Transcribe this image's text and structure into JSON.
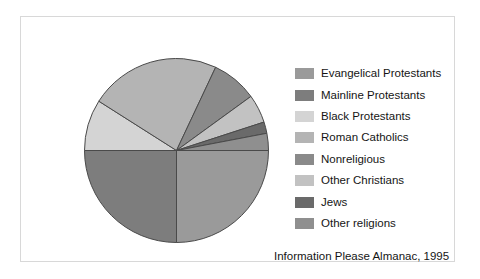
{
  "figure": {
    "caption": "Information Please Almanac, 1995"
  },
  "legend": {
    "position": "right",
    "items": [
      {
        "label": "Evangelical Protestants",
        "color": "#9a9a9a",
        "swatch_name": "legend-swatch-evangelical-protestants"
      },
      {
        "label": "Mainline Protestants",
        "color": "#7d7d7d",
        "swatch_name": "legend-swatch-mainline-protestants"
      },
      {
        "label": "Black Protestants",
        "color": "#d4d4d4",
        "swatch_name": "legend-swatch-black-protestants"
      },
      {
        "label": "Roman Catholics",
        "color": "#b4b4b4",
        "swatch_name": "legend-swatch-roman-catholics"
      },
      {
        "label": "Nonreligious",
        "color": "#8a8a8a",
        "swatch_name": "legend-swatch-nonreligious"
      },
      {
        "label": "Other Christians",
        "color": "#c2c2c2",
        "swatch_name": "legend-swatch-other-christians"
      },
      {
        "label": "Jews",
        "color": "#6a6a6a",
        "swatch_name": "legend-swatch-jews"
      },
      {
        "label": "Other religions",
        "color": "#8f8f8f",
        "swatch_name": "legend-swatch-other-religions"
      }
    ]
  },
  "chart_data": {
    "type": "pie",
    "title": "",
    "xlabel": "",
    "ylabel": "",
    "grid": false,
    "legend_position": "right",
    "start_angle_deg": 0,
    "direction": "clockwise",
    "categories": [
      "Evangelical Protestants",
      "Mainline Protestants",
      "Black Protestants",
      "Roman Catholics",
      "Nonreligious",
      "Other Christians",
      "Jews",
      "Other religions"
    ],
    "values": [
      25,
      25,
      9,
      23,
      8,
      5,
      2,
      3
    ],
    "units": "percent",
    "colors": [
      "#9a9a9a",
      "#7d7d7d",
      "#d4d4d4",
      "#b4b4b4",
      "#8a8a8a",
      "#c2c2c2",
      "#6a6a6a",
      "#8f8f8f"
    ],
    "slice_edge_color": "#4a4a4a",
    "geometry": {
      "center_x": 93.5,
      "center_y": 93.5,
      "radius": 92
    }
  }
}
